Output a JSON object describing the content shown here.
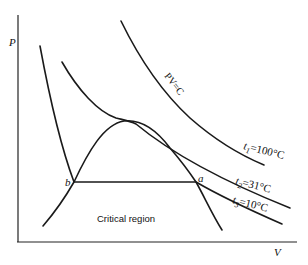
{
  "diagram": {
    "title": "",
    "axes": {
      "y_label": "P",
      "x_label": "V"
    },
    "curves": [
      {
        "id": "t1",
        "label_var": "t",
        "label_sub": "1",
        "label_value": "=100°C",
        "note": "PV=C"
      },
      {
        "id": "t2",
        "label_var": "t",
        "label_sub": "2",
        "label_value": "=31°C"
      },
      {
        "id": "t3",
        "label_var": "t",
        "label_sub": "3",
        "label_value": "=10°C"
      }
    ],
    "hyperbola_label": "PV=C",
    "points": {
      "a": "a",
      "b": "b"
    },
    "region_label": "Critical region"
  }
}
